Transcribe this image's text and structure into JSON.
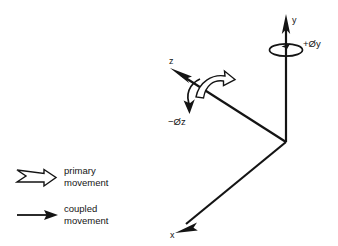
{
  "figure": {
    "background_color": "#ffffff",
    "ink_color": "#141414",
    "axes": [
      {
        "id": "y",
        "label": "y",
        "direction": "up",
        "arrow": "solid"
      },
      {
        "id": "z",
        "label": "z",
        "direction": "up-left",
        "arrow": "solid"
      },
      {
        "id": "x",
        "label": "x",
        "direction": "down-left",
        "arrow": "solid"
      }
    ],
    "rotations": [
      {
        "id": "phi-y",
        "label": "+Øy",
        "about_axis": "y",
        "sign": "+",
        "movement": "coupled"
      },
      {
        "id": "phi-z",
        "label": "−Øz",
        "about_axis": "z",
        "sign": "−",
        "movement": "primary"
      }
    ]
  },
  "legend": {
    "items": [
      {
        "marker": "hollow-block-arrow-icon",
        "line1": "primary",
        "line2": "movement"
      },
      {
        "marker": "solid-thin-arrow-icon",
        "line1": "coupled",
        "line2": "movement"
      }
    ]
  }
}
